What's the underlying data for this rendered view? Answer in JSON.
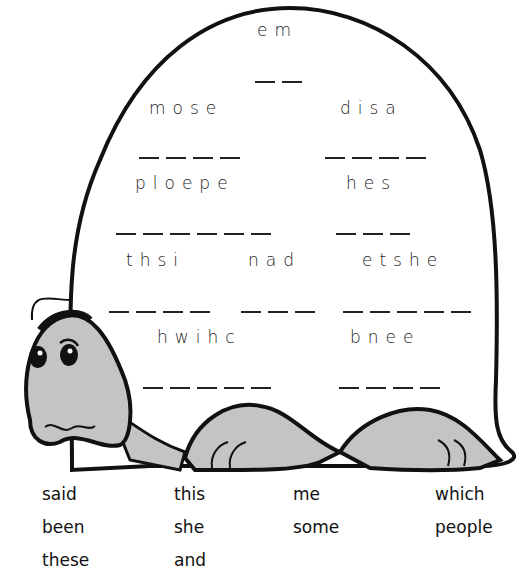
{
  "worksheet": {
    "colors": {
      "ink": "#111111",
      "shell": "#ffffff",
      "skin": "#c4c4c4"
    },
    "scrambled_words": [
      {
        "id": "w1",
        "letters": "em",
        "blanks": 2
      },
      {
        "id": "w2",
        "letters": "mose",
        "blanks": 4
      },
      {
        "id": "w3",
        "letters": "disa",
        "blanks": 4
      },
      {
        "id": "w4",
        "letters": "ploepe",
        "blanks": 6
      },
      {
        "id": "w5",
        "letters": "hes",
        "blanks": 3
      },
      {
        "id": "w6",
        "letters": "thsi",
        "blanks": 4
      },
      {
        "id": "w7",
        "letters": "nad",
        "blanks": 3
      },
      {
        "id": "w8",
        "letters": "etshe",
        "blanks": 5
      },
      {
        "id": "w9",
        "letters": "hwihc",
        "blanks": 5
      },
      {
        "id": "w10",
        "letters": "bnee",
        "blanks": 4
      }
    ],
    "word_bank": [
      [
        "said",
        "this",
        "me",
        "which"
      ],
      [
        "been",
        "she",
        "some",
        "people"
      ],
      [
        "these",
        "and"
      ]
    ],
    "illustration": "turtle-with-shell"
  }
}
